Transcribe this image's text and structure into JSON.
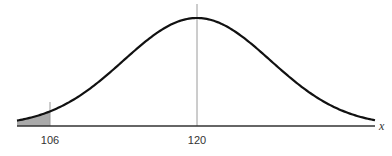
{
  "chart_data": {
    "type": "area",
    "title": "",
    "xlabel": "x",
    "ylabel": "",
    "distribution": "normal",
    "mean": 120,
    "std_dev_estimate": 7,
    "x_range": [
      102.9,
      137
    ],
    "ticks": [
      {
        "value": 106,
        "label": "106"
      },
      {
        "value": 120,
        "label": "120"
      }
    ],
    "shaded_region": {
      "from": "left tail",
      "to": 106,
      "color": "#aaaaaa"
    },
    "reference_lines": [
      106,
      120
    ],
    "grid": false,
    "legend": null,
    "colors": {
      "curve": "#111111",
      "axis": "#333333",
      "reference_line": "#999999",
      "shade": "#aaaaaa"
    }
  },
  "labels": {
    "tick_106": "106",
    "tick_120": "120",
    "axis_x": "x"
  }
}
